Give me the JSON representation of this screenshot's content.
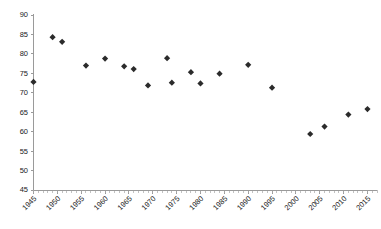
{
  "chart_data": {
    "type": "scatter",
    "title": "",
    "subtitle": "",
    "xlabel": "",
    "ylabel": "",
    "xlim": [
      1945,
      2017
    ],
    "ylim": [
      45,
      90
    ],
    "grid": false,
    "legend": null,
    "marker_shape": "diamond",
    "marker_color": "#2b2b2b",
    "x_tick_labels": [
      "1945",
      "1950",
      "1955",
      "1960",
      "1965",
      "1970",
      "1975",
      "1980",
      "1985",
      "1990",
      "1995",
      "2000",
      "2005",
      "2010",
      "2015"
    ],
    "x_tick_values": [
      1945,
      1950,
      1955,
      1960,
      1965,
      1970,
      1975,
      1980,
      1985,
      1990,
      1995,
      2000,
      2005,
      2010,
      2015
    ],
    "x_tick_rotation": -45,
    "x_minor_tick_step": 1,
    "y_tick_labels": [
      "45",
      "50",
      "55",
      "60",
      "65",
      "70",
      "75",
      "80",
      "85",
      "90"
    ],
    "y_tick_values": [
      45,
      50,
      55,
      60,
      65,
      70,
      75,
      80,
      85,
      90
    ],
    "points": [
      {
        "x": 1945,
        "y": 72.8
      },
      {
        "x": 1949,
        "y": 84.3
      },
      {
        "x": 1951,
        "y": 83.1
      },
      {
        "x": 1956,
        "y": 77.0
      },
      {
        "x": 1960,
        "y": 78.8
      },
      {
        "x": 1964,
        "y": 76.8
      },
      {
        "x": 1966,
        "y": 76.1
      },
      {
        "x": 1969,
        "y": 71.9
      },
      {
        "x": 1973,
        "y": 78.9
      },
      {
        "x": 1974,
        "y": 72.6
      },
      {
        "x": 1978,
        "y": 75.3
      },
      {
        "x": 1980,
        "y": 72.4
      },
      {
        "x": 1984,
        "y": 74.9
      },
      {
        "x": 1990,
        "y": 77.2
      },
      {
        "x": 1995,
        "y": 71.3
      },
      {
        "x": 2003,
        "y": 59.4
      },
      {
        "x": 2006,
        "y": 61.3
      },
      {
        "x": 2011,
        "y": 64.4
      },
      {
        "x": 2015,
        "y": 65.8
      }
    ]
  }
}
